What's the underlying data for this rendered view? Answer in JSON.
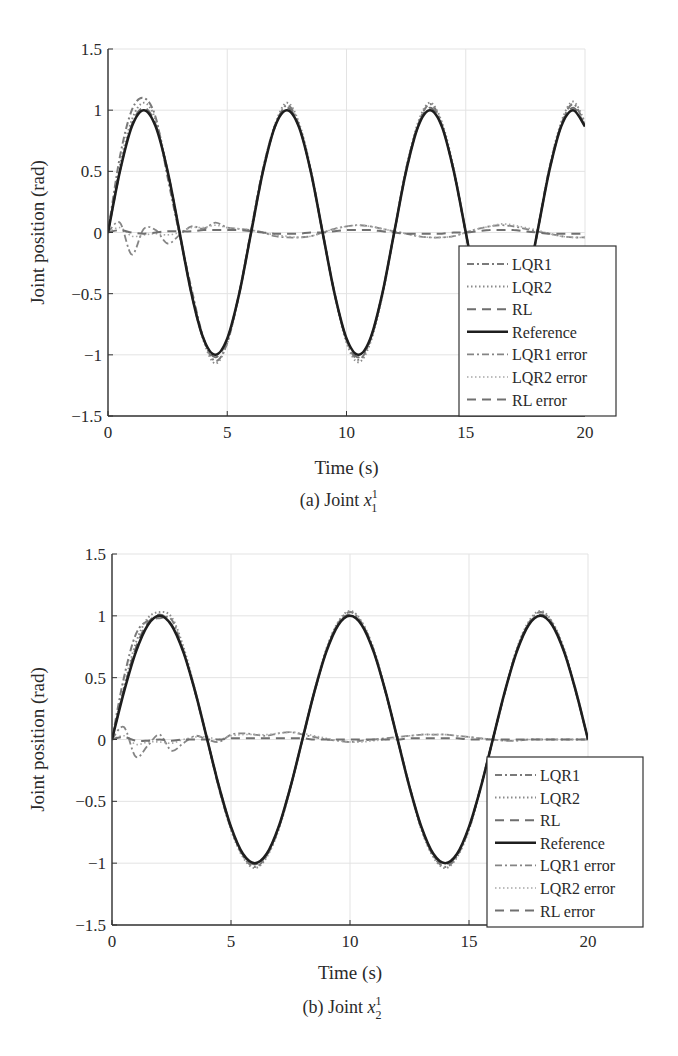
{
  "chart_data": [
    {
      "id": "a",
      "type": "line",
      "title": "",
      "caption": "(a) Joint",
      "caption_var": "x",
      "caption_sup": "1",
      "caption_sub": "1",
      "xlabel": "Time (s)",
      "ylabel": "Joint position (rad)",
      "xlim": [
        0,
        20
      ],
      "ylim": [
        -1.5,
        1.5
      ],
      "xticks": [
        0,
        5,
        10,
        15,
        20
      ],
      "xtick_labels": [
        "0",
        "5",
        "10",
        "15",
        "20"
      ],
      "yticks": [
        -1.5,
        -1,
        -0.5,
        0,
        0.5,
        1,
        1.5
      ],
      "ytick_labels": [
        "−1.5",
        "−1",
        "−0.5",
        "0",
        "0.5",
        "1",
        "1.5"
      ],
      "grid": true,
      "legend_position": "lower right",
      "x": [
        0,
        0.5,
        1,
        1.5,
        2,
        2.5,
        3,
        3.5,
        4,
        4.5,
        5,
        5.5,
        6,
        6.5,
        7,
        7.5,
        8,
        8.5,
        9,
        9.5,
        10,
        10.5,
        11,
        11.5,
        12,
        12.5,
        13,
        13.5,
        14,
        14.5,
        15,
        15.5,
        16,
        16.5,
        17,
        17.5,
        18,
        18.5,
        19,
        19.5,
        20
      ],
      "series": [
        {
          "name": "LQR1",
          "style": "dashdot",
          "color": "#7a7a7a",
          "width": 2,
          "values": [
            0,
            0.62,
            1.0,
            1.1,
            0.94,
            0.45,
            -0.02,
            -0.46,
            -0.86,
            -1.05,
            -0.9,
            -0.5,
            0.02,
            0.52,
            0.86,
            1.04,
            0.88,
            0.5,
            0.0,
            -0.5,
            -0.88,
            -1.04,
            -0.88,
            -0.5,
            0.0,
            0.52,
            0.88,
            1.05,
            0.88,
            0.5,
            0.0,
            -0.5,
            -0.88,
            -1.04,
            -0.88,
            -0.5,
            0.0,
            0.52,
            0.88,
            1.05,
            0.88
          ]
        },
        {
          "name": "LQR2",
          "style": "dotted",
          "color": "#8a8a8a",
          "width": 2,
          "values": [
            0,
            0.55,
            0.92,
            1.06,
            0.92,
            0.5,
            0.0,
            -0.48,
            -0.88,
            -1.07,
            -0.9,
            -0.5,
            0.0,
            0.52,
            0.88,
            1.06,
            0.9,
            0.52,
            0.0,
            -0.5,
            -0.9,
            -1.06,
            -0.9,
            -0.52,
            0.0,
            0.52,
            0.9,
            1.06,
            0.9,
            0.52,
            0.0,
            -0.52,
            -0.9,
            -1.06,
            -0.9,
            -0.52,
            0.0,
            0.52,
            0.9,
            1.07,
            0.9
          ]
        },
        {
          "name": "RL",
          "style": "dashed",
          "color": "#6e6e6e",
          "width": 2,
          "values": [
            0,
            0.5,
            0.88,
            1.02,
            0.88,
            0.5,
            0.0,
            -0.5,
            -0.87,
            -1.02,
            -0.87,
            -0.5,
            0.0,
            0.5,
            0.87,
            1.02,
            0.87,
            0.5,
            0.0,
            -0.5,
            -0.87,
            -1.02,
            -0.87,
            -0.5,
            0.0,
            0.5,
            0.87,
            1.02,
            0.87,
            0.5,
            0.0,
            -0.5,
            -0.87,
            -1.02,
            -0.87,
            -0.5,
            0.0,
            0.5,
            0.87,
            1.02,
            0.87
          ]
        },
        {
          "name": "Reference",
          "style": "solid",
          "color": "#1e1e1e",
          "width": 2.6,
          "values": [
            0,
            0.5,
            0.866,
            1,
            0.866,
            0.5,
            0,
            -0.5,
            -0.866,
            -1,
            -0.866,
            -0.5,
            0,
            0.5,
            0.866,
            1,
            0.866,
            0.5,
            0,
            -0.5,
            -0.866,
            -1,
            -0.866,
            -0.5,
            0,
            0.5,
            0.866,
            1,
            0.866,
            0.5,
            0,
            -0.5,
            -0.866,
            -1,
            -0.866,
            -0.5,
            0,
            0.5,
            0.866,
            1,
            0.866
          ]
        },
        {
          "name": "LQR1 error",
          "style": "dashdot",
          "color": "#858585",
          "width": 1.8,
          "values": [
            0,
            0.08,
            -0.18,
            0.03,
            0.02,
            -0.09,
            -0.02,
            0.05,
            0.03,
            0.08,
            0.04,
            0.03,
            0.02,
            0.0,
            -0.03,
            -0.04,
            -0.04,
            -0.03,
            0.0,
            0.03,
            0.05,
            0.06,
            0.05,
            0.03,
            0.01,
            -0.01,
            -0.03,
            -0.04,
            -0.04,
            -0.03,
            0.0,
            0.03,
            0.05,
            0.06,
            0.05,
            0.03,
            0.01,
            -0.01,
            -0.03,
            -0.04,
            -0.04
          ]
        },
        {
          "name": "LQR2 error",
          "style": "dotted",
          "color": "#a8a8a8",
          "width": 1.6,
          "values": [
            0,
            0.04,
            -0.03,
            -0.02,
            -0.01,
            -0.02,
            0.0,
            0.04,
            0.04,
            0.06,
            0.04,
            0.03,
            0.02,
            0.0,
            -0.02,
            -0.03,
            -0.04,
            -0.03,
            0.0,
            0.03,
            0.05,
            0.06,
            0.05,
            0.03,
            0.01,
            -0.01,
            -0.03,
            -0.04,
            -0.04,
            -0.03,
            0.0,
            0.03,
            0.05,
            0.07,
            0.06,
            0.04,
            0.02,
            -0.01,
            -0.03,
            -0.04,
            -0.04
          ]
        },
        {
          "name": "RL error",
          "style": "dashed",
          "color": "#707070",
          "width": 2,
          "values": [
            0,
            0.02,
            0.0,
            -0.01,
            0.0,
            0.01,
            0.01,
            0.01,
            0.02,
            0.02,
            0.02,
            0.02,
            0.01,
            0.0,
            -0.01,
            -0.01,
            -0.01,
            0.0,
            0.0,
            0.01,
            0.02,
            0.02,
            0.02,
            0.01,
            0.0,
            -0.01,
            -0.01,
            -0.01,
            -0.01,
            0.0,
            0.0,
            0.01,
            0.02,
            0.02,
            0.02,
            0.01,
            0.0,
            -0.01,
            -0.01,
            -0.01,
            -0.01
          ]
        }
      ]
    },
    {
      "id": "b",
      "type": "line",
      "title": "",
      "caption": "(b) Joint",
      "caption_var": "x",
      "caption_sup": "1",
      "caption_sub": "2",
      "xlabel": "Time (s)",
      "ylabel": "Joint position (rad)",
      "xlim": [
        0,
        20
      ],
      "ylim": [
        -1.5,
        1.5
      ],
      "xticks": [
        0,
        5,
        10,
        15,
        20
      ],
      "xtick_labels": [
        "0",
        "5",
        "10",
        "15",
        "20"
      ],
      "yticks": [
        -1.5,
        -1,
        -0.5,
        0,
        0.5,
        1,
        1.5
      ],
      "ytick_labels": [
        "−1.5",
        "−1",
        "−0.5",
        "0",
        "0.5",
        "1",
        "1.5"
      ],
      "grid": true,
      "legend_position": "lower right",
      "x": [
        0,
        0.5,
        1,
        1.5,
        2,
        2.5,
        3,
        3.5,
        4,
        4.5,
        5,
        5.5,
        6,
        6.5,
        7,
        7.5,
        8,
        8.5,
        9,
        9.5,
        10,
        10.5,
        11,
        11.5,
        12,
        12.5,
        13,
        13.5,
        14,
        14.5,
        15,
        15.5,
        16,
        16.5,
        17,
        17.5,
        18,
        18.5,
        19,
        19.5,
        20
      ],
      "series": [
        {
          "name": "LQR1",
          "style": "dashdot",
          "color": "#7a7a7a",
          "width": 2,
          "values": [
            0,
            0.5,
            0.85,
            0.96,
            0.98,
            0.97,
            0.72,
            0.38,
            0.0,
            -0.4,
            -0.72,
            -0.94,
            -1.03,
            -0.94,
            -0.72,
            -0.38,
            0.0,
            0.38,
            0.72,
            0.94,
            1.03,
            0.94,
            0.72,
            0.38,
            0.0,
            -0.38,
            -0.72,
            -0.94,
            -1.03,
            -0.94,
            -0.72,
            -0.38,
            0.0,
            0.38,
            0.72,
            0.94,
            1.03,
            0.94,
            0.72,
            0.38,
            0.0
          ]
        },
        {
          "name": "LQR2",
          "style": "dotted",
          "color": "#8a8a8a",
          "width": 2,
          "values": [
            0,
            0.42,
            0.78,
            0.98,
            1.03,
            0.99,
            0.75,
            0.39,
            0.0,
            -0.39,
            -0.73,
            -0.95,
            -1.04,
            -0.95,
            -0.73,
            -0.39,
            0.0,
            0.39,
            0.73,
            0.95,
            1.04,
            0.95,
            0.73,
            0.39,
            0.0,
            -0.39,
            -0.73,
            -0.95,
            -1.04,
            -0.95,
            -0.73,
            -0.39,
            0.0,
            0.39,
            0.73,
            0.95,
            1.04,
            0.95,
            0.73,
            0.39,
            0.0
          ]
        },
        {
          "name": "RL",
          "style": "dashed",
          "color": "#6e6e6e",
          "width": 2,
          "values": [
            0,
            0.4,
            0.74,
            0.94,
            1.01,
            0.93,
            0.71,
            0.38,
            0.0,
            -0.38,
            -0.71,
            -0.93,
            -1.01,
            -0.93,
            -0.71,
            -0.38,
            0.0,
            0.38,
            0.71,
            0.93,
            1.01,
            0.93,
            0.71,
            0.38,
            0.0,
            -0.38,
            -0.71,
            -0.93,
            -1.01,
            -0.93,
            -0.71,
            -0.38,
            0.0,
            0.38,
            0.71,
            0.93,
            1.01,
            0.93,
            0.71,
            0.38,
            0.0
          ]
        },
        {
          "name": "Reference",
          "style": "solid",
          "color": "#1e1e1e",
          "width": 2.6,
          "values": [
            0,
            0.383,
            0.707,
            0.924,
            1,
            0.924,
            0.707,
            0.383,
            0,
            -0.383,
            -0.707,
            -0.924,
            -1,
            -0.924,
            -0.707,
            -0.383,
            0,
            0.383,
            0.707,
            0.924,
            1,
            0.924,
            0.707,
            0.383,
            0,
            -0.383,
            -0.707,
            -0.924,
            -1,
            -0.924,
            -0.707,
            -0.383,
            0,
            0.383,
            0.707,
            0.924,
            1,
            0.924,
            0.707,
            0.383,
            0
          ]
        },
        {
          "name": "LQR1 error",
          "style": "dashdot",
          "color": "#858585",
          "width": 1.8,
          "values": [
            0,
            0.1,
            -0.14,
            -0.05,
            0.04,
            -0.09,
            -0.03,
            0.03,
            0.0,
            -0.02,
            0.04,
            0.05,
            0.04,
            0.03,
            0.05,
            0.06,
            0.04,
            0.02,
            0.0,
            -0.01,
            -0.02,
            -0.01,
            0.0,
            0.01,
            0.02,
            0.03,
            0.04,
            0.04,
            0.04,
            0.03,
            0.02,
            0.01,
            0.0,
            -0.01,
            -0.01,
            0.0,
            0.0,
            0.0,
            0.0,
            0.0,
            0.0
          ]
        },
        {
          "name": "LQR2 error",
          "style": "dotted",
          "color": "#a8a8a8",
          "width": 1.6,
          "values": [
            0,
            0.03,
            -0.04,
            -0.02,
            -0.02,
            -0.03,
            0.0,
            0.02,
            0.02,
            0.0,
            0.03,
            0.04,
            0.04,
            0.04,
            0.05,
            0.06,
            0.05,
            0.03,
            0.01,
            -0.01,
            -0.02,
            -0.02,
            -0.01,
            0.0,
            0.02,
            0.03,
            0.04,
            0.04,
            0.04,
            0.03,
            0.02,
            0.01,
            0.0,
            -0.01,
            -0.01,
            0.0,
            0.0,
            0.0,
            0.0,
            0.0,
            0.0
          ]
        },
        {
          "name": "RL error",
          "style": "dashed",
          "color": "#707070",
          "width": 2,
          "values": [
            0,
            0.02,
            -0.01,
            -0.01,
            0.0,
            -0.01,
            0.0,
            0.0,
            0.0,
            0.0,
            0.01,
            0.01,
            0.01,
            0.01,
            0.01,
            0.01,
            0.01,
            0.0,
            0.0,
            0.0,
            0.0,
            0.0,
            0.0,
            0.0,
            0.0,
            0.01,
            0.01,
            0.01,
            0.01,
            0.01,
            0.0,
            0.0,
            0.0,
            0.0,
            0.0,
            0.0,
            0.0,
            0.0,
            0.0,
            0.0,
            0.0
          ]
        }
      ]
    }
  ],
  "layout": {
    "plots": [
      {
        "left": 108,
        "right": 585,
        "top": 49,
        "bottom": 416,
        "legend": {
          "left": 459,
          "top": 246,
          "right": 616,
          "bottom": 416,
          "row_start": 264,
          "row_step": 22.6
        },
        "xlabel_y": 474,
        "caption_y": 506,
        "ylabel_x": 44
      },
      {
        "left": 112,
        "right": 588,
        "top": 26,
        "bottom": 397,
        "legend": {
          "left": 487,
          "top": 229,
          "right": 643,
          "bottom": 399,
          "row_start": 247,
          "row_step": 22.6
        },
        "xlabel_y": 451,
        "caption_y": 485,
        "ylabel_x": 44
      }
    ]
  }
}
